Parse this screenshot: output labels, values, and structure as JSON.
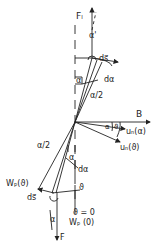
{
  "diagram": {
    "labels": {
      "force_top": "Fₗ",
      "force_top_sub": "L",
      "alpha_prime": "α'",
      "ds_top": "ds⃗",
      "ds_top_sub": "L",
      "alpha_top": "α",
      "dalpha_top": "dα",
      "half_alpha_top": "α/2",
      "B": "B",
      "alpha_right": "α",
      "theta_right": "ϑ",
      "un_alpha": "uₙ(α)",
      "un_theta": "uₙ(ϑ)",
      "half_alpha_bottom": "α/2",
      "alpha_mid": "α",
      "dalpha_bottom": "dα",
      "wp_theta": "Wₚ(ϑ)",
      "ds_bottom": "ds⃗",
      "ds_bottom_sub": "2",
      "theta_bottom": "ϑ",
      "theta_zero": "ϑ = 0",
      "wp_zero": "Wₚ (0)",
      "alpha_bottom": "α",
      "force_bottom": "F",
      "force_bottom_sub": "2"
    },
    "colors": {
      "ink": "#222222",
      "background": "#ffffff"
    }
  }
}
